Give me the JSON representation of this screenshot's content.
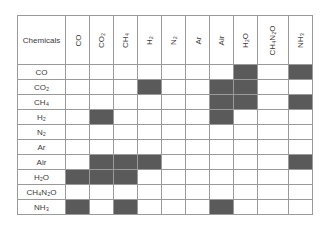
{
  "table": {
    "corner_label": "Chemicals",
    "columns": [
      "CO",
      "CO₂",
      "CH₄",
      "H₂",
      "N₂",
      "Ar",
      "Air",
      "H₂O",
      "CH₄N₂O",
      "NH₃"
    ],
    "rows": [
      {
        "label": "CO",
        "filled": [
          false,
          false,
          false,
          false,
          false,
          false,
          false,
          true,
          false,
          true
        ]
      },
      {
        "label": "CO₂",
        "filled": [
          false,
          false,
          false,
          true,
          false,
          false,
          true,
          true,
          false,
          false
        ]
      },
      {
        "label": "CH₄",
        "filled": [
          false,
          false,
          false,
          false,
          false,
          false,
          true,
          true,
          false,
          true
        ]
      },
      {
        "label": "H₂",
        "filled": [
          false,
          true,
          false,
          false,
          false,
          false,
          true,
          false,
          false,
          false
        ]
      },
      {
        "label": "N₂",
        "filled": [
          false,
          false,
          false,
          false,
          false,
          false,
          false,
          false,
          false,
          false
        ]
      },
      {
        "label": "Ar",
        "filled": [
          false,
          false,
          false,
          false,
          false,
          false,
          false,
          false,
          false,
          false
        ]
      },
      {
        "label": "Air",
        "filled": [
          false,
          true,
          true,
          true,
          false,
          false,
          false,
          false,
          false,
          true
        ]
      },
      {
        "label": "H₂O",
        "filled": [
          true,
          true,
          true,
          false,
          false,
          false,
          false,
          false,
          false,
          false
        ]
      },
      {
        "label": "CH₄N₂O",
        "filled": [
          false,
          false,
          false,
          false,
          false,
          false,
          false,
          false,
          false,
          false
        ]
      },
      {
        "label": "NH₃",
        "filled": [
          true,
          false,
          true,
          false,
          false,
          false,
          true,
          false,
          false,
          false
        ]
      }
    ],
    "fill_color": "#5a5a5a",
    "border_color": "#9a9a9a"
  }
}
